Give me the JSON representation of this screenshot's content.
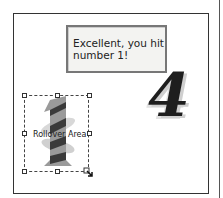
{
  "message_box": {
    "text_line1": "Excellent, you hit",
    "text_line2": "number 1!"
  },
  "rollover": {
    "label": "Rollover Area"
  },
  "numbers": {
    "four": "4",
    "one": "1"
  },
  "colors": {
    "frame": "#333333",
    "message_bg": "#f3f3f1",
    "message_border": "#777777"
  }
}
